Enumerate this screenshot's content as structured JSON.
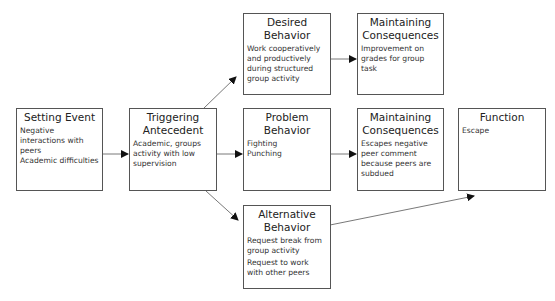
{
  "diagram": {
    "nodes": [
      {
        "id": "setting-event",
        "title": "Setting Event",
        "items": [
          "Negative interactions with peers",
          "Academic difficulties"
        ]
      },
      {
        "id": "triggering-antecedent",
        "title": "Triggering Antecedent",
        "items": [
          "Academic, groups activity with low supervision"
        ]
      },
      {
        "id": "desired-behavior",
        "title": "Desired Behavior",
        "items": [
          "Work cooperatively and productively during structured group activity"
        ]
      },
      {
        "id": "desired-consequences",
        "title": "Maintaining Consequences",
        "items": [
          "Improvement on grades for group task"
        ]
      },
      {
        "id": "problem-behavior",
        "title": "Problem Behavior",
        "items": [
          "Fighting",
          "Punching"
        ]
      },
      {
        "id": "problem-consequences",
        "title": "Maintaining Consequences",
        "items": [
          "Escapes negative peer comment because peers are subdued"
        ]
      },
      {
        "id": "function",
        "title": "Function",
        "items": [
          "Escape"
        ]
      },
      {
        "id": "alternative-behavior",
        "title": "Alternative Behavior",
        "items": [
          "Request break from group activity",
          "Request to work with other peers"
        ]
      }
    ],
    "edges": [
      {
        "from": "setting-event",
        "to": "triggering-antecedent"
      },
      {
        "from": "triggering-antecedent",
        "to": "desired-behavior"
      },
      {
        "from": "triggering-antecedent",
        "to": "problem-behavior"
      },
      {
        "from": "triggering-antecedent",
        "to": "alternative-behavior"
      },
      {
        "from": "desired-behavior",
        "to": "desired-consequences"
      },
      {
        "from": "problem-behavior",
        "to": "problem-consequences"
      },
      {
        "from": "alternative-behavior",
        "to": "function"
      }
    ],
    "colors": {
      "border": "#555555",
      "arrow": "#444444",
      "text": "#222222"
    }
  }
}
